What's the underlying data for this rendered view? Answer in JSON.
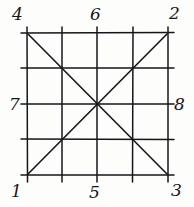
{
  "figure": {
    "kind": "hand-drawn-grid-diagram",
    "ink_color": "#16161a",
    "background_color": "#fdfdfc"
  },
  "labels": {
    "top_left": "4",
    "top_middle": "6",
    "top_right": "2",
    "left_middle": "7",
    "right_middle": "8",
    "bottom_left": "1",
    "bottom_middle": "5",
    "bottom_right": "3"
  },
  "geometry": {
    "square": {
      "left": 27,
      "top": 33,
      "right": 168,
      "bottom": 175
    },
    "vertical_lines_x": [
      27,
      62,
      97,
      133,
      168
    ],
    "horizontal_lines_y": [
      33,
      68,
      104,
      139,
      175
    ],
    "diagonals": [
      {
        "from": "top_left_corner",
        "to": "bottom_right_corner"
      },
      {
        "from": "bottom_left_corner",
        "to": "top_right_corner"
      }
    ],
    "overshoot_px": 7
  }
}
